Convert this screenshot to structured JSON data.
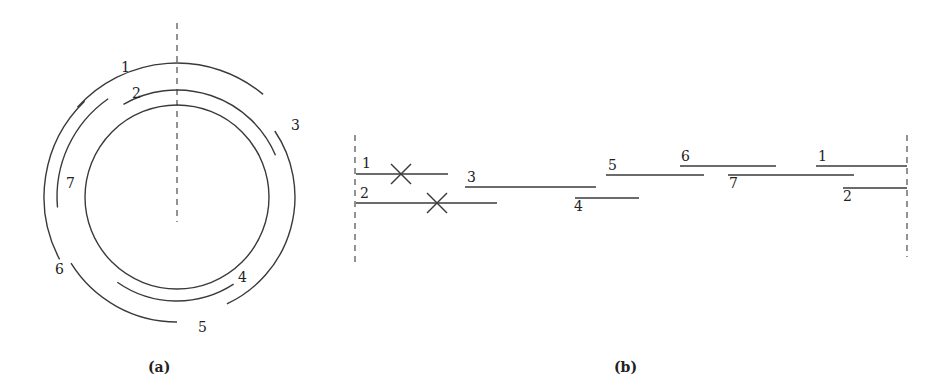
{
  "figure": {
    "panel_a": {
      "caption": "(a)",
      "center": [
        177,
        197
      ],
      "inner_circle_radius": 92,
      "axis_dashed": {
        "x": 177,
        "y1": 23,
        "y2": 222
      },
      "arcs": [
        {
          "id": "1",
          "label": "1",
          "radius": 134,
          "start_deg": -48,
          "end_deg": 40,
          "label_pos": [
            121,
            72
          ]
        },
        {
          "id": "2",
          "label": "2",
          "radius": 107,
          "start_deg": -30,
          "end_deg": 67,
          "label_pos": [
            132,
            98
          ]
        },
        {
          "id": "3",
          "label": "3",
          "radius": 118,
          "start_deg": 56,
          "end_deg": 155,
          "label_pos": [
            291,
            130
          ]
        },
        {
          "id": "4",
          "label": "4",
          "radius": 104,
          "start_deg": 147,
          "end_deg": 215,
          "label_pos": [
            238,
            282
          ]
        },
        {
          "id": "5",
          "label": "5",
          "radius": 125,
          "start_deg": 180,
          "end_deg": 238,
          "label_pos": [
            198,
            332
          ]
        },
        {
          "id": "6",
          "label": "6",
          "radius": 133,
          "start_deg": 242,
          "end_deg": 316,
          "label_pos": [
            55,
            274
          ]
        },
        {
          "id": "7",
          "label": "7",
          "radius": 120,
          "start_deg": 265,
          "end_deg": 325,
          "label_pos": [
            66,
            188
          ]
        }
      ]
    },
    "panel_b": {
      "caption": "(b)",
      "dashed_left": {
        "x": 355,
        "y1": 135,
        "y2": 265
      },
      "dashed_right": {
        "x": 907,
        "y1": 135,
        "y2": 257
      },
      "segments": [
        {
          "id": "1",
          "label": "1",
          "x1": 356,
          "x2": 448,
          "y": 174,
          "label_pos": [
            362,
            168
          ],
          "crossed": true,
          "cross_at": [
            401,
            174
          ]
        },
        {
          "id": "2",
          "label": "2",
          "x1": 356,
          "x2": 497,
          "y": 203,
          "label_pos": [
            360,
            198
          ],
          "crossed": true,
          "cross_at": [
            437,
            203
          ]
        },
        {
          "id": "3",
          "label": "3",
          "x1": 465,
          "x2": 596,
          "y": 187,
          "label_pos": [
            467,
            182
          ]
        },
        {
          "id": "4",
          "label": "4",
          "x1": 575,
          "x2": 639,
          "y": 198,
          "label_pos": [
            574,
            211
          ]
        },
        {
          "id": "5",
          "label": "5",
          "x1": 606,
          "x2": 704,
          "y": 175,
          "label_pos": [
            608,
            170
          ]
        },
        {
          "id": "6",
          "label": "6",
          "x1": 680,
          "x2": 776,
          "y": 166,
          "label_pos": [
            681,
            161
          ]
        },
        {
          "id": "7",
          "label": "7",
          "x1": 728,
          "x2": 854,
          "y": 175,
          "label_pos": [
            729,
            188
          ]
        },
        {
          "id": "1r",
          "label": "1",
          "x1": 816,
          "x2": 907,
          "y": 166,
          "label_pos": [
            818,
            161
          ]
        },
        {
          "id": "2r",
          "label": "2",
          "x1": 843,
          "x2": 907,
          "y": 188,
          "label_pos": [
            843,
            201
          ]
        }
      ]
    }
  }
}
